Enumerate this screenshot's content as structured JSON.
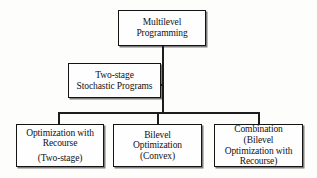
{
  "diagram": {
    "type": "tree",
    "colors": {
      "background": "#fdfdfc",
      "box_fill": "#fefefe",
      "border": "#141414",
      "line": "#1d1d1d",
      "text": "#111111"
    },
    "nodes": [
      {
        "id": "root",
        "lines": [
          "Multilevel",
          "Programming"
        ],
        "line1": "Multilevel",
        "line2": "Programming"
      },
      {
        "id": "twostage",
        "lines": [
          "Two-stage",
          "Stochastic Programs"
        ],
        "line1": "Two-stage",
        "line2": "Stochastic Programs"
      },
      {
        "id": "recourse",
        "lines": [
          "Optimization with",
          "Recourse",
          "(Two-stage)"
        ],
        "line1": "Optimization with",
        "line2": "Recourse",
        "line3": "(Two-stage)"
      },
      {
        "id": "bilevel",
        "lines": [
          "Bilevel",
          "Optimization",
          "(Convex)"
        ],
        "line1": "Bilevel",
        "line2": "Optimization",
        "line3": "(Convex)"
      },
      {
        "id": "combination",
        "lines": [
          "Combination",
          "(Bilevel",
          "Optimization with",
          "Recourse)"
        ],
        "line1": "Combination",
        "line2": "(Bilevel",
        "line3": "Optimization with",
        "line4": "Recourse)"
      }
    ],
    "edges": [
      {
        "from": "root",
        "to": "twostage"
      },
      {
        "from": "root",
        "to": "recourse"
      },
      {
        "from": "root",
        "to": "bilevel"
      },
      {
        "from": "root",
        "to": "combination"
      }
    ]
  }
}
